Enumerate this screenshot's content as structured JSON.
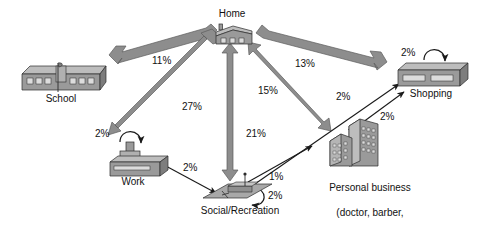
{
  "figure": {
    "type": "trip-chaining-flow-diagram",
    "background_color": "#ffffff",
    "thick_arrow_fill": "#8d8d8d",
    "thick_arrow_stroke": "#5a5a5a",
    "thin_arrow_color": "#1a1a1a",
    "icon_fill": "#9a9a9a",
    "icon_stroke": "#2b2b2b",
    "text_color": "#111111"
  },
  "nodes": [
    {
      "id": "home",
      "label": "Home",
      "icon": "house-icon"
    },
    {
      "id": "school",
      "label": "School",
      "icon": "school-building-icon"
    },
    {
      "id": "work",
      "label": "Work",
      "icon": "factory-icon"
    },
    {
      "id": "shopping",
      "label": "Shopping",
      "icon": "store-slab-icon"
    },
    {
      "id": "personal_business",
      "label": "Personal business",
      "label_line2": "(doctor, barber,",
      "label_line3": "lawyer, etc.)",
      "icon": "office-tower-icon"
    },
    {
      "id": "social",
      "label": "Social/Recreation",
      "icon": "park-plaza-icon"
    }
  ],
  "edges": [
    {
      "id": "home-school",
      "from": "home",
      "to": "school",
      "value": "11%",
      "style": "thick",
      "arrow": "double"
    },
    {
      "id": "home-work",
      "from": "home",
      "to": "work",
      "value": "27%",
      "style": "thick",
      "arrow": "double"
    },
    {
      "id": "home-social",
      "from": "home",
      "to": "social",
      "value": "21%",
      "style": "thick",
      "arrow": "double"
    },
    {
      "id": "home-personal",
      "from": "home",
      "to": "personal_business",
      "value": "15%",
      "style": "thick",
      "arrow": "double"
    },
    {
      "id": "home-shopping",
      "from": "home",
      "to": "shopping",
      "value": "13%",
      "style": "thick",
      "arrow": "double"
    },
    {
      "id": "work-social",
      "from": "work",
      "to": "social",
      "value": "2%",
      "style": "thin",
      "arrow": "double"
    },
    {
      "id": "social-personal",
      "from": "social",
      "to": "personal_business",
      "value": "1%",
      "style": "thin",
      "arrow": "double"
    },
    {
      "id": "social-shopping",
      "from": "social",
      "to": "shopping",
      "value": "2%",
      "style": "thin",
      "arrow": "double"
    },
    {
      "id": "personal-shopping",
      "from": "personal_business",
      "to": "shopping",
      "value": "2%",
      "style": "thin",
      "arrow": "double"
    }
  ],
  "self_loops": [
    {
      "id": "work-loop",
      "node": "work",
      "value": "2%"
    },
    {
      "id": "shopping-loop",
      "node": "shopping",
      "value": "2%"
    },
    {
      "id": "social-loop",
      "node": "social",
      "value": "2%"
    }
  ],
  "labels": {
    "home": "Home",
    "school": "School",
    "work": "Work",
    "shopping": "Shopping",
    "social": "Social/Recreation",
    "personal_business_line1": "Personal business",
    "personal_business_line2": "(doctor, barber,",
    "personal_business_line3": "lawyer, etc.)"
  },
  "values": {
    "home_school": "11%",
    "home_work": "27%",
    "home_social": "21%",
    "home_personal": "15%",
    "home_shopping": "13%",
    "work_social": "2%",
    "social_personal": "1%",
    "social_shopping": "2%",
    "personal_shopping": "2%",
    "work_loop": "2%",
    "shopping_loop": "2%",
    "social_loop": "2%"
  }
}
